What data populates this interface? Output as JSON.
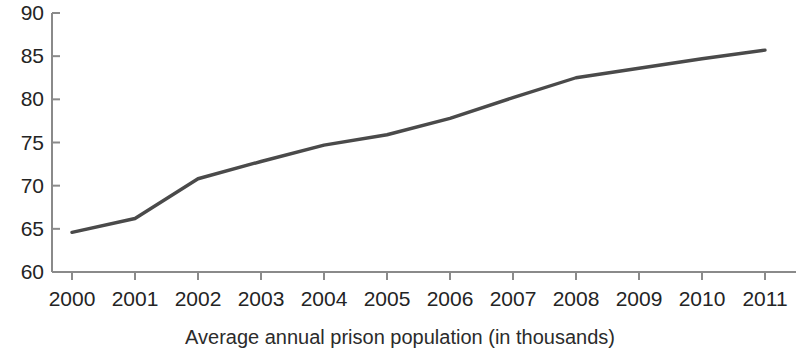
{
  "chart_data": {
    "type": "line",
    "title": "",
    "subtitle": "",
    "xlabel": "Average annual prison population (in thousands)",
    "ylabel": "",
    "x": [
      2000,
      2001,
      2002,
      2003,
      2004,
      2005,
      2006,
      2007,
      2008,
      2009,
      2010,
      2011
    ],
    "categories": [
      "2000",
      "2001",
      "2002",
      "2003",
      "2004",
      "2005",
      "2006",
      "2007",
      "2008",
      "2009",
      "2010",
      "2011"
    ],
    "series": [
      {
        "name": "Average annual prison population",
        "values": [
          64.6,
          66.2,
          70.8,
          72.8,
          74.7,
          75.9,
          77.8,
          80.2,
          82.5,
          83.6,
          84.7,
          85.7
        ]
      }
    ],
    "values": [
      64.6,
      66.2,
      70.8,
      72.8,
      74.7,
      75.9,
      77.8,
      80.2,
      82.5,
      83.6,
      84.7,
      85.7
    ],
    "ylim": [
      60,
      90
    ],
    "ytick_labels": [
      "60",
      "65",
      "70",
      "75",
      "80",
      "85",
      "90"
    ],
    "ytick_values": [
      60,
      65,
      70,
      75,
      80,
      85,
      90
    ],
    "xtick_labels": [
      "2000",
      "2001",
      "2002",
      "2003",
      "2004",
      "2005",
      "2006",
      "2007",
      "2008",
      "2009",
      "2010",
      "2011"
    ],
    "grid": false,
    "legend": false,
    "legend_position": "none",
    "line_color": "#4a4a4a",
    "axis_color": "#8a8a8a",
    "text_color": "#242424",
    "background_color": "#ffffff"
  }
}
